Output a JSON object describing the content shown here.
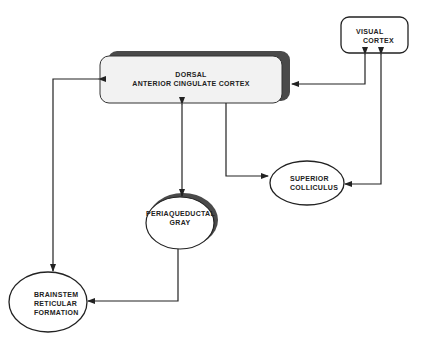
{
  "diagram": {
    "nodes": [
      {
        "id": "dacc",
        "label_line1": "DORSAL",
        "label_line2": "ANTERIOR CINGULATE CORTEX",
        "shape": "rounded-rect-shadow"
      },
      {
        "id": "visual_cortex",
        "label_line1": "VISUAL",
        "label_line2": "CORTEX",
        "shape": "rounded-rect"
      },
      {
        "id": "superior_colliculus",
        "label_line1": "SUPERIOR",
        "label_line2": "COLLICULUS",
        "shape": "ellipse"
      },
      {
        "id": "pag",
        "label_line1": "PERIAQUEDUCTAL",
        "label_line2": "GRAY",
        "shape": "ellipse-shadow"
      },
      {
        "id": "brainstem",
        "label_line1": "BRAINSTEM",
        "label_line2": "RETICULAR",
        "label_line3": "FORMATION",
        "shape": "ellipse"
      }
    ],
    "edges": [
      {
        "from": "visual_cortex",
        "to": "dacc",
        "direction": "bidirectional"
      },
      {
        "from": "dacc",
        "to": "superior_colliculus",
        "direction": "forward"
      },
      {
        "from": "visual_cortex",
        "to": "superior_colliculus",
        "direction": "bidirectional"
      },
      {
        "from": "dacc",
        "to": "pag",
        "direction": "bidirectional"
      },
      {
        "from": "dacc",
        "to": "brainstem",
        "direction": "bidirectional"
      },
      {
        "from": "pag",
        "to": "brainstem",
        "direction": "forward"
      }
    ],
    "colors": {
      "line": "#222222",
      "box_fill": "#f2f2f2",
      "shadow": "#4a4a4a",
      "background": "#ffffff"
    }
  }
}
